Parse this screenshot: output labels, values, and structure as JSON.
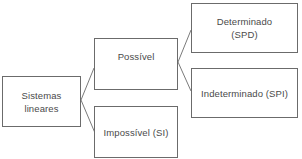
{
  "diagram": {
    "type": "tree",
    "direction": "left-to-right",
    "colors": {
      "border": "#6b6b6b",
      "text": "#4a4a4a",
      "background": "#ffffff"
    },
    "nodes": {
      "root": {
        "line1": "Sistemas",
        "line2": "lineares"
      },
      "possivel": {
        "label": "Possível"
      },
      "impossivel": {
        "label": "Impossível (SI)"
      },
      "determinado": {
        "line1": "Determinado",
        "line2": "(SPD)"
      },
      "indeterminado": {
        "label": "Indeterminado (SPI)"
      }
    },
    "edges": [
      {
        "from": "root",
        "to": "possivel"
      },
      {
        "from": "root",
        "to": "impossivel"
      },
      {
        "from": "possivel",
        "to": "determinado"
      },
      {
        "from": "possivel",
        "to": "indeterminado"
      }
    ]
  }
}
